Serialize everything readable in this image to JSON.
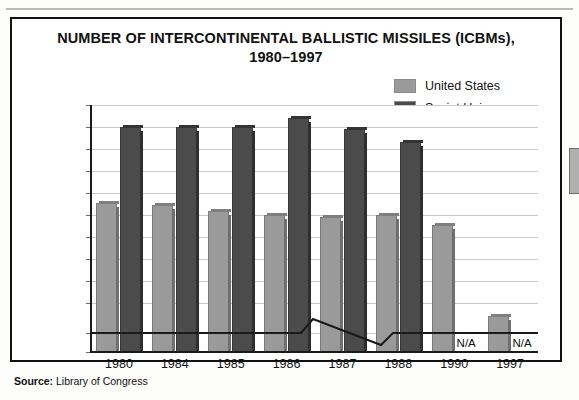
{
  "figure": {
    "title_line1": "NUMBER OF INTERCONTINENTAL BALLISTIC MISSILES (ICBMs),",
    "title_line2": "1980–1997",
    "source_label": "Source:",
    "source_text": "Library of Congress"
  },
  "chart_data": {
    "type": "bar",
    "title": "NUMBER OF INTERCONTINENTAL BALLISTIC MISSILES (ICBMs), 1980–1997",
    "xlabel": "",
    "ylabel": "Number of missiles",
    "categories": [
      "1980",
      "1984",
      "1985",
      "1986",
      "1987",
      "1988",
      "1990",
      "1997"
    ],
    "series": [
      {
        "name": "United States",
        "color": "#9a9a9a",
        "values": [
          1055,
          1045,
          1020,
          1000,
          990,
          1000,
          955,
          540
        ],
        "labels": [
          "",
          "",
          "",
          "",
          "",
          "",
          "",
          ""
        ]
      },
      {
        "name": "Soviet Union",
        "color": "#4b4b4b",
        "values": [
          1400,
          1400,
          1400,
          1440,
          1390,
          1330,
          null,
          null
        ],
        "labels": [
          "",
          "",
          "",
          "",
          "",
          "",
          "N/A",
          "N/A"
        ]
      }
    ],
    "ylim": [
      0,
      1500
    ],
    "yticks": [
      0,
      500,
      600,
      700,
      800,
      900,
      1000,
      1100,
      1200,
      1300,
      1400,
      1500
    ],
    "ytick_labels": [
      "0",
      "500",
      "600",
      "700",
      "800",
      "900",
      "1,000",
      "1,100",
      "1,200",
      "1,300",
      "1,400",
      "1,500"
    ],
    "axis_break": true,
    "axis_break_note": "y-axis broken between 0 and 500",
    "grid": true,
    "legend_position": "top-right",
    "na_text": "N/A"
  },
  "legend": {
    "items": [
      {
        "label": "United States",
        "color": "#9a9a9a"
      },
      {
        "label": "Soviet Union",
        "color": "#4b4b4b"
      }
    ]
  }
}
